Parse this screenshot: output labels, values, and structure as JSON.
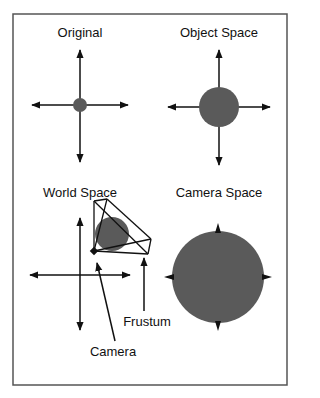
{
  "figure": {
    "frame": {
      "x": 13,
      "y": 14,
      "w": 274,
      "h": 371,
      "stroke": "#555555"
    },
    "colors": {
      "line": "#111111",
      "sphere": "#5a5a5a"
    },
    "panels": [
      {
        "id": "original",
        "title": "Original",
        "title_x": 80,
        "title_y": 26,
        "center": [
          80,
          105
        ],
        "h_axis": [
          32,
          128
        ],
        "v_axis": [
          50,
          162
        ],
        "sphere_r": 7
      },
      {
        "id": "object-space",
        "title": "Object Space",
        "title_x": 219,
        "title_y": 26,
        "center": [
          219,
          107
        ],
        "h_axis": [
          168,
          270
        ],
        "v_axis": [
          50,
          165
        ],
        "sphere_r": 20
      },
      {
        "id": "world-space",
        "title": "World Space",
        "title_x": 80,
        "title_y": 186,
        "center": [
          80,
          275
        ],
        "h_axis": [
          30,
          130
        ],
        "v_axis": [
          218,
          330
        ],
        "sphere_r": 17,
        "sphere_center": [
          112,
          234
        ]
      },
      {
        "id": "camera-space",
        "title": "Camera Space",
        "title_x": 219,
        "title_y": 186,
        "center": [
          218,
          277
        ],
        "sphere_r": 46,
        "arrow_tips": true
      }
    ],
    "frustum": {
      "apex": [
        94,
        251
      ],
      "near": [
        [
          94,
          201
        ],
        [
          107,
          199
        ]
      ],
      "far": [
        [
          151,
          239
        ],
        [
          148,
          254
        ]
      ]
    },
    "camera_marker": {
      "x": 94,
      "y": 251,
      "size": 6
    },
    "annotations": [
      {
        "id": "frustum-label",
        "text": "Frustum",
        "x": 147,
        "y": 315,
        "arrow_from": [
          144,
          311
        ],
        "arrow_to": [
          144,
          258
        ]
      },
      {
        "id": "camera-label",
        "text": "Camera",
        "x": 113,
        "y": 345,
        "arrow_from": [
          115,
          341
        ],
        "arrow_to": [
          97,
          263
        ]
      }
    ]
  }
}
